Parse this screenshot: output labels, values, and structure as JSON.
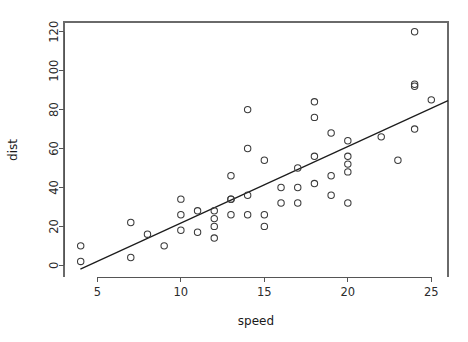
{
  "chart_data": {
    "type": "scatter",
    "title": "",
    "xlabel": "speed",
    "ylabel": "dist",
    "xlim": [
      3.0,
      26.0
    ],
    "ylim": [
      -6.0,
      125.0
    ],
    "grid": false,
    "legend": null,
    "point_symbol": "open-circle",
    "x": [
      4,
      4,
      7,
      7,
      8,
      9,
      10,
      10,
      10,
      11,
      11,
      12,
      12,
      12,
      12,
      13,
      13,
      13,
      13,
      14,
      14,
      14,
      14,
      15,
      15,
      15,
      16,
      16,
      17,
      17,
      17,
      18,
      18,
      18,
      18,
      19,
      19,
      19,
      20,
      20,
      20,
      20,
      20,
      22,
      23,
      24,
      24,
      24,
      24,
      25
    ],
    "y": [
      2,
      10,
      4,
      22,
      16,
      10,
      18,
      26,
      34,
      17,
      28,
      14,
      20,
      24,
      28,
      26,
      34,
      34,
      46,
      26,
      36,
      60,
      80,
      20,
      26,
      54,
      32,
      40,
      32,
      40,
      50,
      42,
      56,
      76,
      84,
      36,
      46,
      68,
      32,
      48,
      52,
      56,
      64,
      66,
      54,
      70,
      92,
      93,
      120,
      85
    ],
    "series": [
      {
        "name": "cars",
        "type": "scatter",
        "x": [
          4,
          4,
          7,
          7,
          8,
          9,
          10,
          10,
          10,
          11,
          11,
          12,
          12,
          12,
          12,
          13,
          13,
          13,
          13,
          14,
          14,
          14,
          14,
          15,
          15,
          15,
          16,
          16,
          17,
          17,
          17,
          18,
          18,
          18,
          18,
          19,
          19,
          19,
          20,
          20,
          20,
          20,
          20,
          22,
          23,
          24,
          24,
          24,
          24,
          25
        ],
        "y": [
          2,
          10,
          4,
          22,
          16,
          10,
          18,
          26,
          34,
          17,
          28,
          14,
          20,
          24,
          28,
          26,
          34,
          34,
          46,
          26,
          36,
          60,
          80,
          20,
          26,
          54,
          32,
          40,
          32,
          40,
          50,
          42,
          56,
          76,
          84,
          36,
          46,
          68,
          32,
          48,
          52,
          56,
          64,
          66,
          54,
          70,
          92,
          93,
          120,
          85
        ]
      },
      {
        "name": "linear-fit",
        "type": "line",
        "intercept": -17.58,
        "slope": 3.93,
        "x_start": 3.98,
        "x_end": 26.0
      }
    ],
    "xticks": [
      5,
      10,
      15,
      20,
      25
    ],
    "xtick_labels": [
      "5",
      "10",
      "15",
      "20",
      "25"
    ],
    "yticks": [
      0,
      20,
      40,
      60,
      80,
      100,
      120
    ],
    "ytick_labels": [
      "0",
      "20",
      "40",
      "60",
      "80",
      "100",
      "120"
    ],
    "colors": {
      "background": "#ffffff",
      "point_stroke": "#3a3a3a",
      "fit_line": "#1c1c1c",
      "axis": "#555555",
      "frame": "#6a6a6a",
      "text": "#1a1a1a"
    },
    "geometry": {
      "plot_left": 64,
      "plot_right": 448,
      "plot_top": 22,
      "plot_bottom": 277,
      "point_radius": 3.2
    }
  }
}
